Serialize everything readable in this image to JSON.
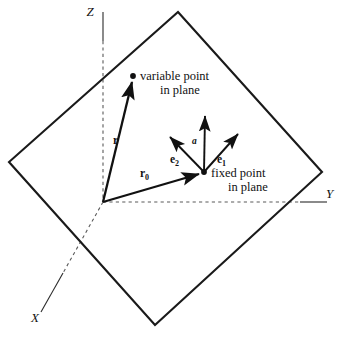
{
  "figure": {
    "background_color": "#ffffff",
    "line_color": "#1a1a1a",
    "axis_color": "#2b2b2b",
    "dashed_color": "#5a5a5a"
  },
  "axes": {
    "z_label": "Z",
    "y_label": "Y",
    "x_label": "X"
  },
  "vectors": {
    "r_label": "r",
    "r0_label": "r",
    "r0_subscript": "0",
    "e1_label": "e",
    "e1_subscript": "1",
    "e2_label": "e",
    "e2_subscript": "2",
    "normal_label": "a"
  },
  "annotations": {
    "variable_point_line1": "variable point",
    "variable_point_line2": "in plane",
    "fixed_point_line1": "fixed point",
    "fixed_point_line2": "in plane"
  },
  "geometry": {
    "plane_vertices": "178,12 322,172 155,325 9,162",
    "origin": {
      "x": 103,
      "y": 202
    },
    "variable_point": {
      "x": 133,
      "y": 76
    },
    "fixed_point": {
      "x": 204,
      "y": 172
    }
  }
}
